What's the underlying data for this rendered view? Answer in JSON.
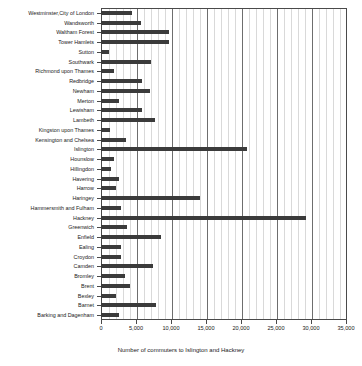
{
  "chart_data": {
    "type": "bar",
    "orientation": "horizontal",
    "title": "",
    "xlabel": "Number of commuters to Islington and Hackney",
    "ylabel": "",
    "xlim": [
      0,
      35000
    ],
    "ylim": null,
    "grid": true,
    "grid_minor_step": 1000,
    "grid_major_step": 5000,
    "legend": null,
    "bar_color": "#3b3b3b",
    "xticks": [
      0,
      5000,
      10000,
      15000,
      20000,
      25000,
      30000,
      35000
    ],
    "xticklabels": [
      "0",
      "5,000",
      "10,000",
      "15,000",
      "20,000",
      "25,000",
      "30,000",
      "35,000"
    ],
    "categories": [
      "Westminster,City of London",
      "Wandsworth",
      "Waltham Forest",
      "Tower Hamlets",
      "Sutton",
      "Southwark",
      "Richmond upon Thames",
      "Redbridge",
      "Newham",
      "Merton",
      "Lewisham",
      "Lambeth",
      "Kingston upon Thames",
      "Kensington and Chelsea",
      "Islington",
      "Hounslow",
      "Hillingdon",
      "Havering",
      "Harrow",
      "Haringey",
      "Hammersmith and Fulham",
      "Hackney",
      "Greenwich",
      "Enfield",
      "Ealing",
      "Croydon",
      "Camden",
      "Bromley",
      "Brent",
      "Bexley",
      "Barnet",
      "Barking and Dagenham"
    ],
    "values": [
      4400,
      5700,
      9700,
      9700,
      1100,
      7200,
      1900,
      5800,
      7000,
      2500,
      5800,
      7700,
      1300,
      3500,
      20900,
      1800,
      1400,
      2600,
      2100,
      14100,
      2800,
      29300,
      3700,
      8500,
      2900,
      2900,
      7400,
      3400,
      4100,
      2200,
      7900,
      2600
    ]
  }
}
